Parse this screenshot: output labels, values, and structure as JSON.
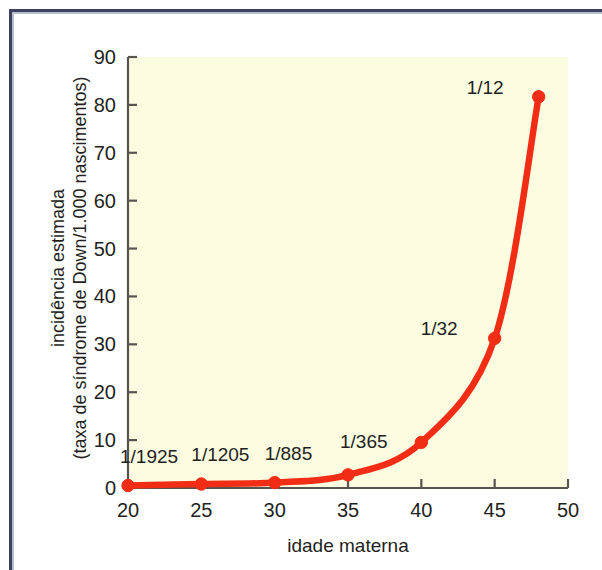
{
  "figure": {
    "background_color": "#ffffff",
    "plot_background_color": "#fcfce1",
    "border_color": "#3c4260",
    "curve_color": "#f22d16",
    "text_color": "#231f20"
  },
  "chart_data": {
    "type": "line",
    "title": "",
    "subtitle": "",
    "xlabel": "idade materna",
    "ylabel_line1": "incidência estimada",
    "ylabel_line2": "(taxa de síndrome de Down/1.000 nascimentos)",
    "xlim": [
      20,
      50
    ],
    "ylim": [
      0,
      90
    ],
    "xticks": [
      20,
      25,
      30,
      35,
      40,
      45,
      50
    ],
    "xticklabels": [
      "20",
      "25",
      "30",
      "35",
      "40",
      "45",
      "50"
    ],
    "yticks": [
      0,
      10,
      20,
      30,
      40,
      50,
      60,
      70,
      80,
      90
    ],
    "yticklabels": [
      "0",
      "10",
      "20",
      "30",
      "40",
      "50",
      "60",
      "70",
      "80",
      "90"
    ],
    "grid": false,
    "legend": "none",
    "series": [
      {
        "name": "incidência estimada de síndrome de Down",
        "color": "#f22d16",
        "marker": "circle",
        "x": [
          20,
          25,
          30,
          35,
          40,
          45,
          48
        ],
        "y": [
          0.52,
          0.83,
          1.13,
          2.74,
          9.52,
          31.25,
          81.7
        ],
        "point_labels": [
          "1/1925",
          "1/1205",
          "1/885",
          "1/365",
          "",
          "1/32",
          "1/12"
        ]
      }
    ],
    "annotations": [
      {
        "text": "1/1925",
        "x": 20,
        "y": 0.52
      },
      {
        "text": "1/1205",
        "x": 25,
        "y": 0.83
      },
      {
        "text": "1/885",
        "x": 30,
        "y": 1.13
      },
      {
        "text": "1/365",
        "x": 35,
        "y": 2.74
      },
      {
        "text": "1/32",
        "x": 45,
        "y": 31.25
      },
      {
        "text": "1/12",
        "x": 48,
        "y": 81.7
      }
    ]
  }
}
